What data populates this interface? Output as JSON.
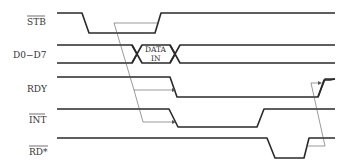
{
  "diagram": {
    "type": "timing-diagram",
    "signals": [
      {
        "name": "STB",
        "active_low": true,
        "label": "STB"
      },
      {
        "name": "D0-D7",
        "active_low": false,
        "label": "D0−D7",
        "bus_label_line1": "DATA",
        "bus_label_line2": "IN"
      },
      {
        "name": "RDY",
        "active_low": false,
        "label": "RDY"
      },
      {
        "name": "INT",
        "active_low": true,
        "label": "INT"
      },
      {
        "name": "RD*",
        "active_low": true,
        "label": "RD*"
      }
    ],
    "annotations": [
      "STB low causes RDY to go low",
      "STB low causes INT to go low",
      "RD* rising causes RDY to go high"
    ],
    "colors": {
      "signal": "#2a2a2a",
      "arrow": "#555555",
      "background": "#ffffff"
    }
  }
}
